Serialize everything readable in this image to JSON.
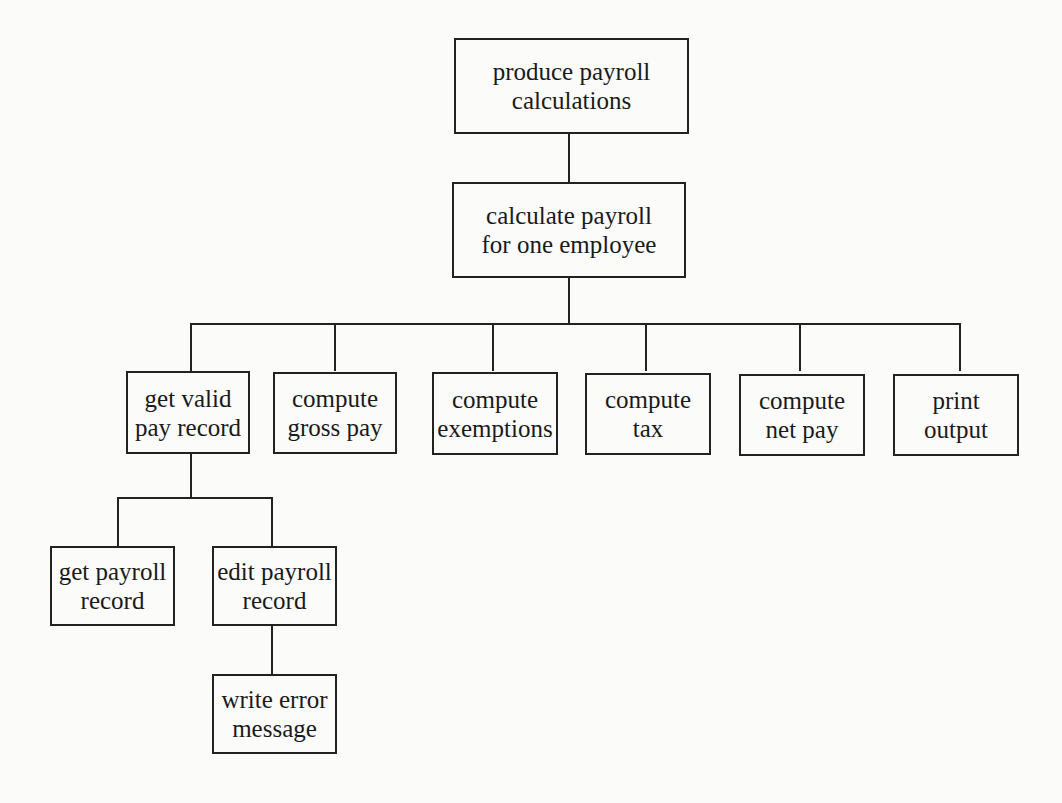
{
  "diagram": {
    "type": "hierarchy-chart",
    "colors": {
      "background": "#fbfbfa",
      "stroke": "#222222",
      "text": "#1a1a1a"
    },
    "nodes": {
      "root": {
        "line1": "produce payroll",
        "line2": "calculations"
      },
      "calc": {
        "line1": "calculate payroll",
        "line2": "for one employee"
      },
      "get_valid": {
        "line1": "get valid",
        "line2": "pay record"
      },
      "gross": {
        "line1": "compute",
        "line2": "gross pay"
      },
      "exemptions": {
        "line1": "compute",
        "line2": "exemptions"
      },
      "tax": {
        "line1": "compute",
        "line2": "tax"
      },
      "net": {
        "line1": "compute",
        "line2": "net pay"
      },
      "print": {
        "line1": "print",
        "line2": "output"
      },
      "get_payroll": {
        "line1": "get payroll",
        "line2": "record"
      },
      "edit_payroll": {
        "line1": "edit payroll",
        "line2": "record"
      },
      "write_error": {
        "line1": "write error",
        "line2": "message"
      }
    },
    "edges": [
      [
        "produce payroll calculations",
        "calculate payroll for one employee"
      ],
      [
        "calculate payroll for one employee",
        "get valid pay record"
      ],
      [
        "calculate payroll for one employee",
        "compute gross pay"
      ],
      [
        "calculate payroll for one employee",
        "compute exemptions"
      ],
      [
        "calculate payroll for one employee",
        "compute tax"
      ],
      [
        "calculate payroll for one employee",
        "compute net pay"
      ],
      [
        "calculate payroll for one employee",
        "print output"
      ],
      [
        "get valid pay record",
        "get payroll record"
      ],
      [
        "get valid pay record",
        "edit payroll record"
      ],
      [
        "edit payroll record",
        "write error message"
      ]
    ]
  }
}
